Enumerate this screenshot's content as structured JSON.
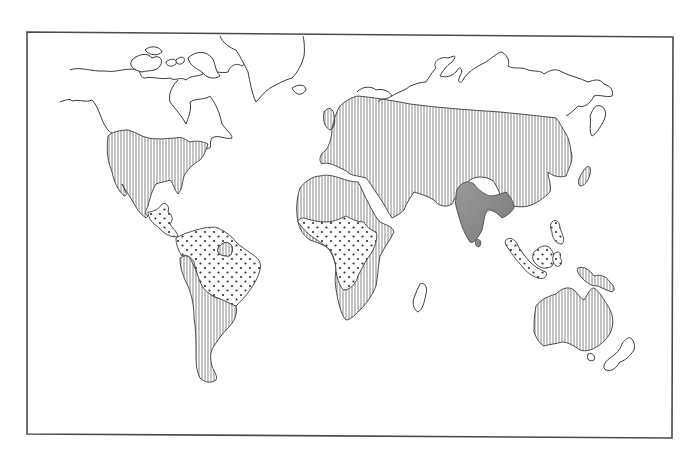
{
  "map": {
    "type": "hand-drawn world outline map",
    "labels_visible": false,
    "legend_visible": false,
    "colors": {
      "background": "#ffffff",
      "outline": "#3a3a3a",
      "frame": "#4a4a4a",
      "hatch_line": "#555555",
      "dot": "#333333",
      "shade": "#8a8a8a"
    },
    "fill_patterns": [
      {
        "id": "vertical-hatch",
        "regions": [
          "North America (USA/Canada south)",
          "Mexico",
          "Western & southern South America",
          "Guiana region",
          "North Africa",
          "Southern & eastern Africa",
          "Europe",
          "Russia/Central Asia",
          "Middle East",
          "China",
          "Japan",
          "New Guinea",
          "Australia"
        ]
      },
      {
        "id": "dots",
        "regions": [
          "Central America",
          "Northern/central South America (Brazil)",
          "West & Central Africa",
          "Southeast Asia (Indochina)",
          "Malaysia",
          "Indonesia",
          "Philippines"
        ]
      },
      {
        "id": "dark-shade",
        "regions": [
          "Indian subcontinent",
          "Sri Lanka"
        ]
      },
      {
        "id": "blank",
        "regions": [
          "Arctic Canada",
          "Greenland",
          "Iceland",
          "Northern Russia",
          "Madagascar",
          "New Zealand",
          "Tasmania"
        ]
      }
    ]
  }
}
